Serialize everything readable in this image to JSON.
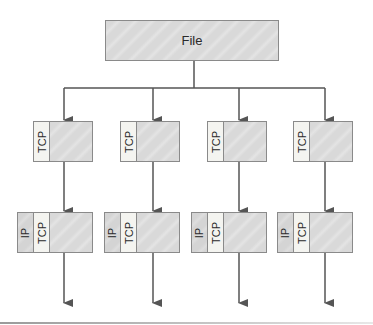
{
  "diagram": {
    "source": {
      "label": "File"
    },
    "segments": [
      {
        "tcp_label": "TCP"
      },
      {
        "tcp_label": "TCP"
      },
      {
        "tcp_label": "TCP"
      },
      {
        "tcp_label": "TCP"
      }
    ],
    "packets": [
      {
        "ip_label": "IP",
        "tcp_label": "TCP"
      },
      {
        "ip_label": "IP",
        "tcp_label": "TCP"
      },
      {
        "ip_label": "IP",
        "tcp_label": "TCP"
      },
      {
        "ip_label": "IP",
        "tcp_label": "TCP"
      }
    ],
    "colors": {
      "line": "#555555",
      "box_fill": "#d9d9d9",
      "header_fill": "#f4f4f0",
      "border": "#8a8a8a"
    }
  }
}
